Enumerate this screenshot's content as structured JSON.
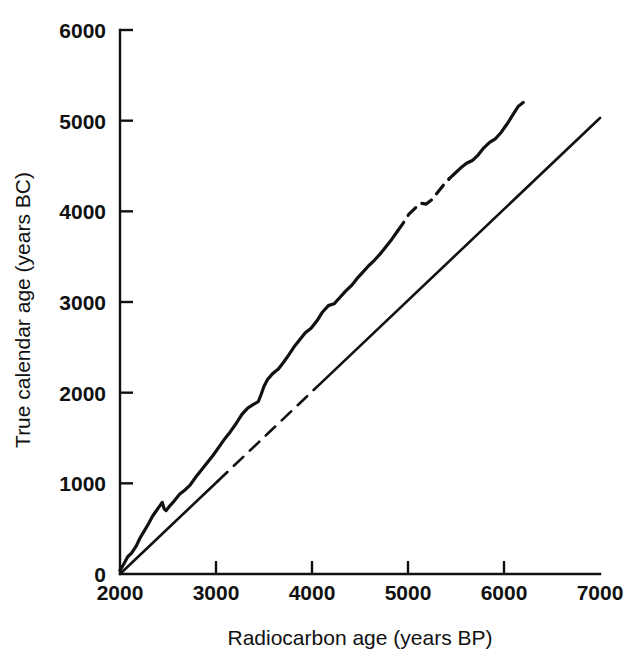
{
  "chart_data": {
    "type": "line",
    "title": "",
    "xlabel": "Radiocarbon age (years BP)",
    "ylabel": "True calendar age (years BC)",
    "xlim": [
      2000,
      7000
    ],
    "ylim": [
      0,
      6000
    ],
    "xticks": [
      2000,
      3000,
      4000,
      5000,
      6000,
      7000
    ],
    "xtick_labels": [
      "2000",
      "3000",
      "4000",
      "5000",
      "6000",
      "7000"
    ],
    "yticks": [
      0,
      1000,
      2000,
      3000,
      4000,
      5000,
      6000
    ],
    "ytick_labels": [
      "0",
      "1000",
      "2000",
      "3000",
      "4000",
      "5000",
      "6000"
    ],
    "grid": false,
    "legend": "none",
    "series": [
      {
        "name": "calibration-curve",
        "style": "solid-with-dashed-interval",
        "dashed_x_range": [
          4890,
          5430
        ],
        "x": [
          2000,
          2040,
          2080,
          2120,
          2170,
          2210,
          2250,
          2300,
          2340,
          2380,
          2420,
          2440,
          2460,
          2480,
          2510,
          2560,
          2620,
          2680,
          2730,
          2790,
          2850,
          2910,
          2970,
          3030,
          3090,
          3150,
          3210,
          3270,
          3330,
          3390,
          3440,
          3470,
          3500,
          3540,
          3590,
          3650,
          3700,
          3760,
          3810,
          3870,
          3930,
          3990,
          4050,
          4110,
          4170,
          4230,
          4290,
          4350,
          4410,
          4470,
          4530,
          4590,
          4650,
          4710,
          4770,
          4830,
          4890,
          4950,
          5010,
          5070,
          5130,
          5190,
          5250,
          5310,
          5370,
          5430,
          5490,
          5550,
          5610,
          5670,
          5730,
          5790,
          5850,
          5910,
          5970,
          6030,
          6090,
          6150,
          6200
        ],
        "y": [
          40,
          110,
          190,
          230,
          310,
          400,
          470,
          560,
          640,
          700,
          760,
          790,
          720,
          700,
          740,
          800,
          880,
          930,
          980,
          1070,
          1150,
          1230,
          1310,
          1400,
          1490,
          1570,
          1660,
          1760,
          1830,
          1870,
          1900,
          1980,
          2070,
          2150,
          2210,
          2260,
          2330,
          2420,
          2500,
          2580,
          2660,
          2710,
          2790,
          2890,
          2960,
          2980,
          3050,
          3120,
          3180,
          3260,
          3330,
          3400,
          3460,
          3530,
          3610,
          3690,
          3780,
          3870,
          3970,
          4030,
          4090,
          4080,
          4130,
          4210,
          4290,
          4360,
          4420,
          4480,
          4530,
          4560,
          4620,
          4700,
          4760,
          4800,
          4870,
          4960,
          5060,
          5160,
          5200
        ]
      },
      {
        "name": "one-to-one-reference-line",
        "style": "solid-with-dashed-interval",
        "dashed_x_range": [
          3020,
          4060
        ],
        "x": [
          2000,
          7000
        ],
        "y": [
          0,
          5030
        ]
      }
    ]
  }
}
